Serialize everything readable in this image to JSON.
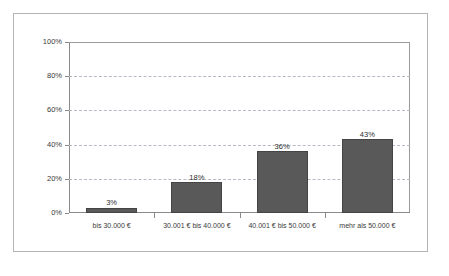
{
  "chart_data": {
    "type": "bar",
    "title": "",
    "subtitle": "",
    "xlabel": "",
    "ylabel": "",
    "categories": [
      "bis 30.000 €",
      "30.001 € bis 40.000 €",
      "40.001 € bis 50.000 €",
      "mehr als 50.000 €"
    ],
    "values": [
      3,
      18,
      36,
      43
    ],
    "value_labels": [
      "3%",
      "18%",
      "36%",
      "43%"
    ],
    "ylim": [
      0,
      100
    ],
    "ytick_values": [
      0,
      20,
      40,
      60,
      80,
      100
    ],
    "ytick_labels": [
      "0%",
      "20%",
      "40%",
      "60%",
      "80%",
      "100%"
    ],
    "grid": true,
    "grid_axis": "y",
    "grid_style": "dashed",
    "legend": false,
    "legend_position": "none",
    "colors": {
      "bar_fill": "#595959",
      "bar_edge": "#444444",
      "gridline": "#b9b9c6",
      "axis": "#8a8a8a",
      "plot_border": "#9a9a9a",
      "outer_frame": "#b4b4b4",
      "background": "#ffffff",
      "text": "#3a3a3a"
    }
  }
}
